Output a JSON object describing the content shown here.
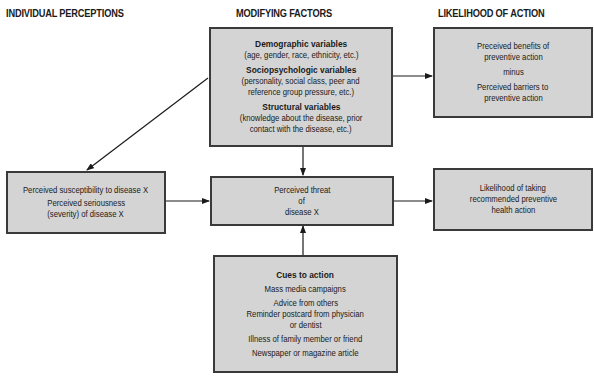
{
  "headers": {
    "individual": "INDIVIDUAL PERCEPTIONS",
    "modifying": "MODIFYING FACTORS",
    "likelihood": "LIKELIHOOD OF ACTION"
  },
  "modifying_box": {
    "demographic_title": "Demographic variables",
    "demographic_detail": "(age, gender, race, ethnicity, etc.)",
    "socio_title": "Sociopsychologic variables",
    "socio_detail_1": "(personality, social class, peer and",
    "socio_detail_2": "reference group pressure, etc.)",
    "structural_title": "Structural variables",
    "structural_detail_1": "(knowledge about the disease, prior",
    "structural_detail_2": "contact with the disease, etc.)"
  },
  "benefits_box": {
    "line1": "Preceived benefits of",
    "line2": "preventive action",
    "line3": "minus",
    "line4": "Perceived barriers to",
    "line5": "preventive action"
  },
  "perceptions_box": {
    "line1": "Perceived susceptibility to disease X",
    "line2": "Perceived seriousness",
    "line3": "(severity) of disease X"
  },
  "threat_box": {
    "line1": "Perceived threat",
    "line2": "of",
    "line3": "disease X"
  },
  "action_box": {
    "line1": "Likelihood of taking",
    "line2": "recommended preventive",
    "line3": "health action"
  },
  "cues_box": {
    "title": "Cues to action",
    "items": [
      "Mass media campaigns",
      "Advice from others",
      "Reminder postcard from physician",
      "or dentist",
      "Illness of family member or friend",
      "Newspaper or magazine article"
    ]
  },
  "colors": {
    "box_fill": "#d4d4d4",
    "box_border": "#3a3a3a",
    "arrow": "#1a1a1a"
  }
}
